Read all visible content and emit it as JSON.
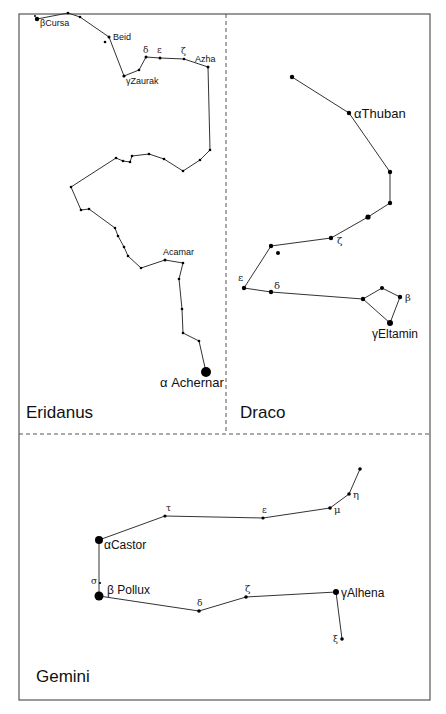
{
  "figure": {
    "panels": [
      {
        "name": "Eridanus",
        "title": "Eridanus",
        "title_pos": [
          26,
          418
        ],
        "stars": [
          {
            "x": 37,
            "y": 19,
            "r": 2.2,
            "label": "βCursa",
            "lx": 40,
            "ly": 26,
            "fs": 9
          },
          {
            "x": 35,
            "y": 16,
            "r": 1.0
          },
          {
            "x": 68,
            "y": 13,
            "r": 1.3
          },
          {
            "x": 80,
            "y": 17,
            "r": 1.3
          },
          {
            "x": 109,
            "y": 37,
            "r": 1.5,
            "label": "Beid",
            "lx": 113,
            "ly": 40,
            "fs": 9
          },
          {
            "x": 105,
            "y": 42,
            "r": 1.3
          },
          {
            "x": 124,
            "y": 76,
            "r": 1.6,
            "label": "γZaurak",
            "lx": 126,
            "ly": 84,
            "fs": 9
          },
          {
            "x": 139,
            "y": 70,
            "r": 1.3
          },
          {
            "x": 146,
            "y": 57,
            "r": 1.5,
            "label": "δ",
            "lx": 143,
            "ly": 53,
            "fs": 9,
            "greek": true
          },
          {
            "x": 160,
            "y": 58,
            "r": 1.5,
            "label": "ε",
            "lx": 157,
            "ly": 53,
            "fs": 9,
            "greek": true
          },
          {
            "x": 184,
            "y": 59,
            "r": 1.3,
            "label": "ζ",
            "lx": 181,
            "ly": 54,
            "fs": 9,
            "greek": true
          },
          {
            "x": 208,
            "y": 67,
            "r": 1.5,
            "label": "Azha",
            "lx": 195,
            "ly": 62,
            "fs": 9
          },
          {
            "x": 210,
            "y": 150,
            "r": 1.3
          },
          {
            "x": 200,
            "y": 160,
            "r": 1.3
          },
          {
            "x": 183,
            "y": 171,
            "r": 1.3
          },
          {
            "x": 164,
            "y": 159,
            "r": 1.3
          },
          {
            "x": 149,
            "y": 154,
            "r": 1.3
          },
          {
            "x": 132,
            "y": 156,
            "r": 1.3
          },
          {
            "x": 130,
            "y": 162,
            "r": 1.3
          },
          {
            "x": 123,
            "y": 161,
            "r": 1.3
          },
          {
            "x": 116,
            "y": 158,
            "r": 1.3
          },
          {
            "x": 71,
            "y": 187,
            "r": 1.3
          },
          {
            "x": 81,
            "y": 210,
            "r": 1.3
          },
          {
            "x": 89,
            "y": 209,
            "r": 1.3
          },
          {
            "x": 115,
            "y": 228,
            "r": 1.3
          },
          {
            "x": 118,
            "y": 236,
            "r": 1.3
          },
          {
            "x": 124,
            "y": 247,
            "r": 1.3
          },
          {
            "x": 128,
            "y": 256,
            "r": 1.3
          },
          {
            "x": 141,
            "y": 268,
            "r": 1.3
          },
          {
            "x": 165,
            "y": 260,
            "r": 1.5,
            "label": "Acamar",
            "lx": 163,
            "ly": 255,
            "fs": 9
          },
          {
            "x": 183,
            "y": 263,
            "r": 1.3
          },
          {
            "x": 179,
            "y": 279,
            "r": 1.3
          },
          {
            "x": 182,
            "y": 309,
            "r": 1.3
          },
          {
            "x": 183,
            "y": 333,
            "r": 1.3
          },
          {
            "x": 199,
            "y": 341,
            "r": 1.3
          },
          {
            "x": 206,
            "y": 372,
            "r": 5,
            "label": "α Achernar",
            "lx": 160,
            "ly": 387,
            "fs": 13
          }
        ],
        "path": [
          [
            37,
            19
          ],
          [
            68,
            13
          ],
          [
            80,
            17
          ],
          [
            109,
            37
          ],
          [
            124,
            76
          ],
          [
            139,
            70
          ],
          [
            146,
            57
          ],
          [
            160,
            58
          ],
          [
            184,
            59
          ],
          [
            208,
            67
          ],
          [
            210,
            150
          ],
          [
            200,
            160
          ],
          [
            183,
            171
          ],
          [
            164,
            159
          ],
          [
            149,
            154
          ],
          [
            132,
            156
          ],
          [
            130,
            162
          ],
          [
            123,
            161
          ],
          [
            116,
            158
          ],
          [
            71,
            187
          ],
          [
            81,
            210
          ],
          [
            89,
            209
          ],
          [
            115,
            228
          ],
          [
            118,
            236
          ],
          [
            124,
            247
          ],
          [
            128,
            256
          ],
          [
            141,
            268
          ],
          [
            165,
            260
          ],
          [
            183,
            263
          ],
          [
            179,
            279
          ],
          [
            182,
            309
          ],
          [
            183,
            333
          ],
          [
            199,
            341
          ],
          [
            206,
            372
          ]
        ]
      },
      {
        "name": "Draco",
        "title": "Draco",
        "title_pos": [
          240,
          418
        ],
        "stars": [
          {
            "x": 292,
            "y": 77,
            "r": 2.2
          },
          {
            "x": 349,
            "y": 113,
            "r": 2.2,
            "label": "αThuban",
            "lx": 354,
            "ly": 118,
            "fs": 13
          },
          {
            "x": 390,
            "y": 172,
            "r": 2.2
          },
          {
            "x": 390,
            "y": 203,
            "r": 2.2
          },
          {
            "x": 368,
            "y": 217,
            "r": 2.6
          },
          {
            "x": 331,
            "y": 238,
            "r": 2.2,
            "label": "ζ",
            "lx": 337,
            "ly": 244,
            "fs": 10,
            "greek": true
          },
          {
            "x": 271,
            "y": 246,
            "r": 2.2
          },
          {
            "x": 278,
            "y": 253,
            "r": 2.0
          },
          {
            "x": 244,
            "y": 288,
            "r": 2.2,
            "label": "ε",
            "lx": 238,
            "ly": 281,
            "fs": 10,
            "greek": true
          },
          {
            "x": 271,
            "y": 292,
            "r": 2.2,
            "label": "δ",
            "lx": 274,
            "ly": 289,
            "fs": 10,
            "greek": true
          },
          {
            "x": 363,
            "y": 299,
            "r": 2.2
          },
          {
            "x": 382,
            "y": 288,
            "r": 2.0
          },
          {
            "x": 400,
            "y": 297,
            "r": 2.2,
            "label": "β",
            "lx": 405,
            "ly": 301,
            "fs": 10,
            "greek": true
          },
          {
            "x": 390,
            "y": 323,
            "r": 3.0,
            "label": "γEltamin",
            "lx": 372,
            "ly": 338,
            "fs": 12
          }
        ],
        "path": [
          [
            292,
            77
          ],
          [
            349,
            113
          ],
          [
            390,
            172
          ],
          [
            390,
            203
          ],
          [
            368,
            217
          ],
          [
            331,
            238
          ],
          [
            271,
            246
          ],
          [
            244,
            288
          ],
          [
            271,
            292
          ],
          [
            363,
            299
          ],
          [
            390,
            323
          ],
          [
            400,
            297
          ],
          [
            382,
            288
          ],
          [
            363,
            299
          ]
        ]
      },
      {
        "name": "Gemini",
        "title": "Gemini",
        "title_pos": [
          36,
          682
        ],
        "stars": [
          {
            "x": 165,
            "y": 516,
            "r": 1.6,
            "label": "τ",
            "lx": 166,
            "ly": 511,
            "fs": 9,
            "greek": true
          },
          {
            "x": 263,
            "y": 518,
            "r": 1.6,
            "label": "ε",
            "lx": 262,
            "ly": 513,
            "fs": 9,
            "greek": true
          },
          {
            "x": 330,
            "y": 508,
            "r": 1.8,
            "label": "μ",
            "lx": 334,
            "ly": 513,
            "fs": 10,
            "greek": true
          },
          {
            "x": 349,
            "y": 494,
            "r": 1.8,
            "label": "η",
            "lx": 353,
            "ly": 498,
            "fs": 10,
            "greek": true
          },
          {
            "x": 360,
            "y": 469,
            "r": 1.8
          },
          {
            "x": 99,
            "y": 540,
            "r": 4,
            "label": "αCastor",
            "lx": 104,
            "ly": 549,
            "fs": 12
          },
          {
            "x": 100,
            "y": 583,
            "r": 1.1,
            "label": "σ",
            "lx": 91,
            "ly": 584,
            "fs": 9,
            "greek": true
          },
          {
            "x": 99,
            "y": 596,
            "r": 4.5,
            "label": "β Pollux",
            "lx": 107,
            "ly": 594,
            "fs": 12
          },
          {
            "x": 199,
            "y": 611,
            "r": 1.8,
            "label": "δ",
            "lx": 197,
            "ly": 606,
            "fs": 9,
            "greek": true
          },
          {
            "x": 246,
            "y": 597,
            "r": 1.8,
            "label": "ζ",
            "lx": 245,
            "ly": 592,
            "fs": 10,
            "greek": true
          },
          {
            "x": 336,
            "y": 592,
            "r": 3,
            "label": "γAlhena",
            "lx": 341,
            "ly": 597,
            "fs": 12
          },
          {
            "x": 342,
            "y": 639,
            "r": 1.8,
            "label": "ξ",
            "lx": 333,
            "ly": 642,
            "fs": 9,
            "greek": true
          }
        ],
        "path": [
          [
            360,
            469
          ],
          [
            349,
            494
          ],
          [
            330,
            508
          ],
          [
            263,
            518
          ],
          [
            165,
            516
          ],
          [
            99,
            540
          ],
          [
            99,
            596
          ],
          [
            199,
            611
          ],
          [
            246,
            597
          ],
          [
            336,
            592
          ],
          [
            342,
            639
          ]
        ]
      }
    ],
    "frame": {
      "x1": 19,
      "y1": 14,
      "x2": 430,
      "y2": 700
    },
    "dividers": {
      "vertical_x": 226,
      "horizontal_y": 434
    },
    "colors": {
      "line": "#333333",
      "star": "#000000",
      "frame": "#555555",
      "background": "#ffffff"
    }
  }
}
